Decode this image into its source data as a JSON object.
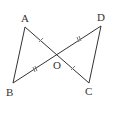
{
  "diagram": {
    "type": "geometry",
    "points": {
      "A": {
        "label": "A",
        "x": 25,
        "y": 27
      },
      "B": {
        "label": "B",
        "x": 13,
        "y": 83
      },
      "C": {
        "label": "C",
        "x": 89,
        "y": 83
      },
      "D": {
        "label": "D",
        "x": 101,
        "y": 26
      },
      "O": {
        "label": "O",
        "x": 58,
        "y": 53
      }
    },
    "segments": [
      [
        "A",
        "B"
      ],
      [
        "A",
        "C"
      ],
      [
        "B",
        "D"
      ],
      [
        "D",
        "C"
      ]
    ],
    "equal_marks": [
      {
        "segment": [
          "A",
          "O"
        ],
        "marks": 1
      },
      {
        "segment": [
          "O",
          "C"
        ],
        "marks": 1
      },
      {
        "segment": [
          "B",
          "O"
        ],
        "marks": 2
      },
      {
        "segment": [
          "O",
          "D"
        ],
        "marks": 2
      }
    ],
    "colors": {
      "stroke": "#333333",
      "tick": "#777777",
      "background": "#ffffff"
    }
  }
}
